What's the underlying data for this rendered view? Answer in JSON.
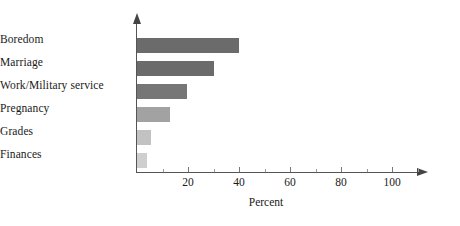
{
  "chart_data": {
    "type": "bar",
    "orientation": "horizontal",
    "title": "",
    "xlabel": "Percent",
    "ylabel": "",
    "categories": [
      "Boredom",
      "Marriage",
      "Work/Military service",
      "Pregnancy",
      "Grades",
      "Finances"
    ],
    "values": [
      40,
      30,
      19.5,
      13,
      5.5,
      4
    ],
    "bar_colors": [
      "#6b6b6b",
      "#6b6b6b",
      "#767676",
      "#a2a2a2",
      "#c2c2c2",
      "#cfcfcf"
    ],
    "xlim": [
      0,
      110
    ],
    "xticks": [
      20,
      40,
      60,
      80,
      100
    ],
    "xtick_labels": [
      "20",
      "40",
      "60",
      "80",
      "100"
    ],
    "xminor_ticks": [
      10,
      30,
      50,
      70,
      90,
      110
    ],
    "grid": false,
    "legend": null,
    "axis_color": "#555555"
  },
  "axis": {
    "x_title": "Percent"
  }
}
